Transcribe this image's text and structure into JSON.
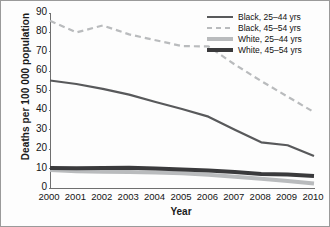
{
  "chart_data": {
    "type": "line",
    "title": "",
    "xlabel": "Year",
    "ylabel": "Deaths per 100 000 population",
    "x": [
      2000,
      2001,
      2002,
      2003,
      2004,
      2005,
      2006,
      2007,
      2008,
      2009,
      2010
    ],
    "categories": [
      "2000",
      "2001",
      "2002",
      "2003",
      "2004",
      "2005",
      "2006",
      "2007",
      "2008",
      "2009",
      "2010"
    ],
    "xlim": [
      2000,
      2010
    ],
    "ylim": [
      0,
      90
    ],
    "yticks": [
      0,
      10,
      20,
      30,
      40,
      50,
      60,
      70,
      80,
      90
    ],
    "ytick_labels": [
      "0",
      "10",
      "20",
      "30",
      "40",
      "50",
      "60",
      "70",
      "80",
      "90"
    ],
    "grid": false,
    "legend_position": "top-right",
    "series": [
      {
        "name": "Black, 25–44 yrs",
        "style": "solid",
        "color": "#58595b",
        "width": 2.2,
        "values": [
          55.3,
          53.5,
          51.0,
          48.0,
          44.2,
          40.6,
          36.7,
          30.0,
          23.5,
          22.0,
          16.5
        ]
      },
      {
        "name": "Black, 45–54 yrs",
        "style": "dashed",
        "color": "#b9bbbd",
        "width": 2.2,
        "values": [
          86.0,
          80.0,
          83.6,
          79.0,
          76.0,
          73.0,
          72.8,
          63.5,
          55.0,
          47.0,
          39.0
        ]
      },
      {
        "name": "White, 25–44 yrs",
        "style": "solid",
        "color": "#b9bbbd",
        "width": 4.0,
        "values": [
          9.3,
          8.6,
          8.4,
          8.2,
          8.0,
          7.6,
          6.8,
          5.8,
          4.8,
          3.6,
          2.3
        ]
      },
      {
        "name": "White, 45–54 yrs",
        "style": "solid",
        "color": "#3a3a3c",
        "width": 4.0,
        "values": [
          10.3,
          10.2,
          10.3,
          10.4,
          10.0,
          9.5,
          9.0,
          8.2,
          7.2,
          7.0,
          6.2
        ]
      }
    ]
  }
}
